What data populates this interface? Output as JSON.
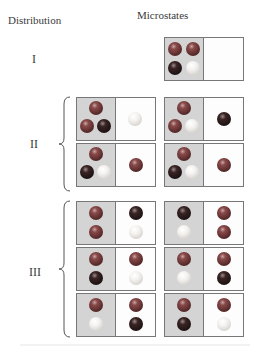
{
  "headers": {
    "distribution": "Distribution",
    "microstates": "Microstates"
  },
  "colors": {
    "red": "#6a3434",
    "dark": "#1e1414",
    "white": "#f0eeec",
    "shaded": "#d4d4d4",
    "border": "#777777"
  },
  "distributions": [
    {
      "label": "I",
      "microstates": [
        {
          "left": [
            "red",
            "red",
            "dark",
            "white"
          ],
          "right": []
        }
      ]
    },
    {
      "label": "II",
      "microstates": [
        {
          "left": [
            "red",
            "red",
            "dark"
          ],
          "right": [
            "white"
          ]
        },
        {
          "left": [
            "red",
            "red",
            "white"
          ],
          "right": [
            "dark"
          ]
        },
        {
          "left": [
            "red",
            "dark",
            "white"
          ],
          "right": [
            "red"
          ]
        },
        {
          "left": [
            "red",
            "dark",
            "white"
          ],
          "right": [
            "red"
          ]
        }
      ]
    },
    {
      "label": "III",
      "microstates": [
        {
          "left": [
            "red",
            "red"
          ],
          "right": [
            "dark",
            "white"
          ]
        },
        {
          "left": [
            "dark",
            "white"
          ],
          "right": [
            "red",
            "red"
          ]
        },
        {
          "left": [
            "red",
            "dark"
          ],
          "right": [
            "red",
            "white"
          ]
        },
        {
          "left": [
            "red",
            "white"
          ],
          "right": [
            "red",
            "dark"
          ]
        },
        {
          "left": [
            "red",
            "white"
          ],
          "right": [
            "red",
            "dark"
          ]
        },
        {
          "left": [
            "red",
            "dark"
          ],
          "right": [
            "red",
            "white"
          ]
        }
      ]
    }
  ]
}
